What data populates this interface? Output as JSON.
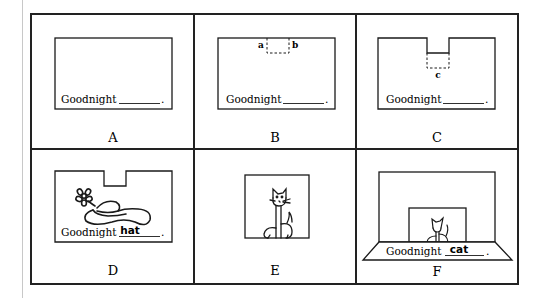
{
  "figure": {
    "panels": [
      {
        "id": "A",
        "label": "A",
        "caption_prefix": "Goodnight",
        "blank_word": "",
        "markers": []
      },
      {
        "id": "B",
        "label": "B",
        "caption_prefix": "Goodnight",
        "blank_word": "",
        "markers": [
          "a",
          "b"
        ]
      },
      {
        "id": "C",
        "label": "C",
        "caption_prefix": "Goodnight",
        "blank_word": "",
        "markers": [
          "c"
        ]
      },
      {
        "id": "D",
        "label": "D",
        "caption_prefix": "Goodnight",
        "blank_word": "hat",
        "illustration": "hat-with-flower",
        "markers": []
      },
      {
        "id": "E",
        "label": "E",
        "caption_prefix": "",
        "blank_word": "",
        "illustration": "cat",
        "markers": []
      },
      {
        "id": "F",
        "label": "F",
        "caption_prefix": "Goodnight",
        "blank_word": "cat",
        "illustration": "cat-in-box-theater",
        "markers": []
      }
    ],
    "punctuation": ".",
    "colors": {
      "line": "#1a1a1a",
      "frame": "#222222",
      "margin_rule": "#c8c8c8",
      "background": "#ffffff"
    }
  }
}
